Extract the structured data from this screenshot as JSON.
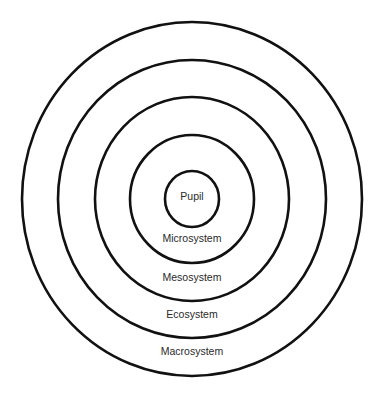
{
  "diagram": {
    "type": "concentric-circles",
    "center": {
      "x": 192,
      "y": 199
    },
    "line_color": "#111111",
    "text_color": "#2a2a2a",
    "rings": [
      {
        "name": "pupil",
        "label": "Pupil",
        "rx": 27,
        "ry": 28,
        "label_y": 197
      },
      {
        "name": "microsystem",
        "label": "Microsystem",
        "rx": 62,
        "ry": 64,
        "label_y": 239
      },
      {
        "name": "mesosystem",
        "label": "Mesosystem",
        "rx": 97,
        "ry": 102,
        "label_y": 278
      },
      {
        "name": "ecosystem",
        "label": "Ecosystem",
        "rx": 134,
        "ry": 139,
        "label_y": 315
      },
      {
        "name": "macrosystem",
        "label": "Macrosystem",
        "rx": 170,
        "ry": 177,
        "label_y": 352
      }
    ]
  }
}
